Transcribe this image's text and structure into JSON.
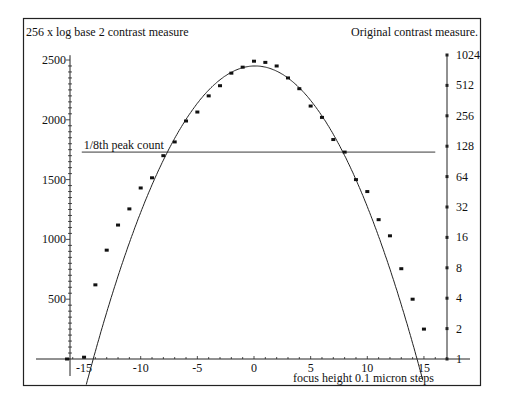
{
  "chart_data": {
    "type": "scatter",
    "title": "",
    "xlabel": "focus height 0.1 micron steps",
    "ylabel": "256 x log base 2 contrast measure",
    "y2label": "Original contrast measure.",
    "xlim": [
      -17,
      20
    ],
    "ylim": [
      -120,
      2550
    ],
    "x_ticks": [
      -15,
      -10,
      -5,
      0,
      5,
      10,
      15
    ],
    "y_ticks": [
      500,
      1000,
      1500,
      2000,
      2500
    ],
    "y2_ticks": [
      1,
      2,
      4,
      8,
      16,
      32,
      64,
      128,
      256,
      512,
      1024
    ],
    "grid": false,
    "legend": null,
    "annotations": [
      {
        "text": "1/8th peak count",
        "type": "hline",
        "y": 1730,
        "x_from": -15.2,
        "x_to": 16
      }
    ],
    "series": [
      {
        "name": "measured contrast",
        "type": "scatter",
        "x": [
          -16.5,
          -15,
          -14,
          -13,
          -12,
          -11,
          -10,
          -9,
          -8,
          -7,
          -6,
          -5,
          -4,
          -3,
          -2,
          -1,
          0,
          1,
          2,
          3,
          4,
          5,
          6,
          7,
          8,
          9,
          10,
          11,
          12,
          13,
          14,
          15
        ],
        "y": [
          0,
          15,
          620,
          910,
          1120,
          1255,
          1430,
          1515,
          1700,
          1815,
          1990,
          2065,
          2200,
          2285,
          2390,
          2440,
          2490,
          2480,
          2450,
          2350,
          2260,
          2115,
          2020,
          1835,
          1730,
          1500,
          1400,
          1165,
          1030,
          755,
          500,
          250
        ]
      },
      {
        "name": "parabolic fit",
        "type": "line",
        "formula": "y = 2450 - 12*(x - 0.1)^2",
        "x_range": [
          -14.8,
          14.9
        ]
      }
    ]
  }
}
